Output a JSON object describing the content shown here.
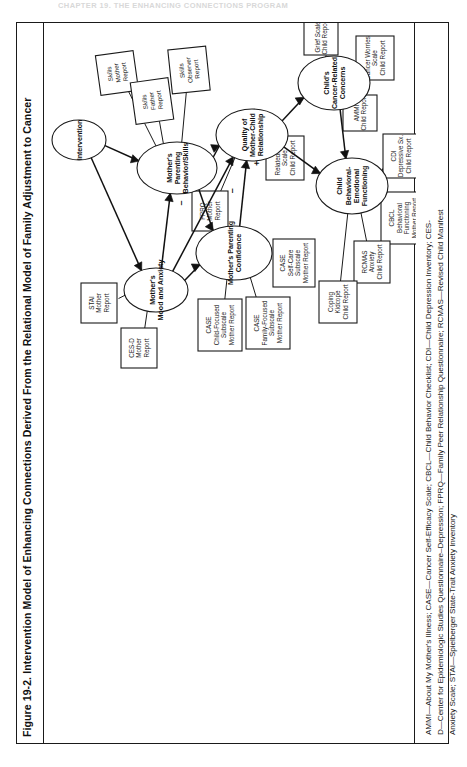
{
  "running_head": "CHAPTER 19. THE ENHANCING CONNECTIONS PROGRAM",
  "figure": {
    "title": "Figure 19-2. Intervention Model of Enhancing Connections Derived From the Relational Model of Family Adjustment to Cancer",
    "legend_line_1": "AMMI—About My Mother's Illness; CASE—Cancer Self-Efficacy Scale; CBCL—Child Behavior Checklist; CDI—Child Depression Inventory; CES-",
    "legend_line_2": "D—Center for Epidemiologic Studies Questionnaire–Depression; FPRQ—Family Peer Relationship Questionnaire; RCMAS—Revised Child Manifest",
    "legend_line_3": "Anxiety Scale; STAI—Spielberger State-Trait Anxiety Inventory"
  },
  "chart_data": {
    "type": "diagram",
    "title": "Intervention Model of Enhancing Connections Derived From the Relational Model of Family Adjustment to Cancer",
    "constructs": [
      {
        "id": "intervention",
        "label": "Intervention"
      },
      {
        "id": "mother_skills",
        "label_lines": [
          "Mother's",
          "Parenting",
          "Behavior/Skills"
        ]
      },
      {
        "id": "mother_mood",
        "label_lines": [
          "Mother's",
          "Mood and Anxiety"
        ]
      },
      {
        "id": "mother_confidence",
        "label_lines": [
          "Mother's Parenting",
          "Confidence"
        ]
      },
      {
        "id": "quality_relationship",
        "label_lines": [
          "Quality of",
          "Mother-Child",
          "Relationship"
        ]
      },
      {
        "id": "child_concerns",
        "label_lines": [
          "Child's",
          "Cancer-Related",
          "Concerns"
        ]
      },
      {
        "id": "child_behavioral",
        "label_lines": [
          "Child",
          "Behavioral-",
          "Emotional",
          "Functioning"
        ]
      }
    ],
    "measures": [
      {
        "id": "skills_mother",
        "lines": [
          "Skills",
          "Mother",
          "Report"
        ],
        "construct": "mother_skills"
      },
      {
        "id": "skills_father",
        "lines": [
          "Skills",
          "Father",
          "Report"
        ],
        "construct": "mother_skills"
      },
      {
        "id": "skills_observer",
        "lines": [
          "Skills",
          "Observer",
          "Report"
        ],
        "construct": "mother_skills"
      },
      {
        "id": "stai_mother",
        "lines": [
          "STAI",
          "Mother",
          "Report"
        ],
        "construct": "mother_mood"
      },
      {
        "id": "cesd_mother",
        "lines": [
          "CES-D",
          "Mother",
          "Report"
        ],
        "construct": "mother_mood"
      },
      {
        "id": "case_child_focused",
        "lines": [
          "CASE",
          "Child-Focused",
          "Subscale",
          "Mother Report"
        ],
        "construct": "mother_confidence"
      },
      {
        "id": "case_family_focused",
        "lines": [
          "CASE",
          "Family-Focused",
          "Subscale",
          "Mother Report"
        ],
        "construct": "mother_confidence"
      },
      {
        "id": "case_self_care",
        "lines": [
          "CASE",
          "Self-Care",
          "Subscale",
          "Mother Report"
        ],
        "construct": "mother_confidence"
      },
      {
        "id": "fprq_mother",
        "lines": [
          "FPRQ",
          "Mother",
          "Report"
        ],
        "construct": "quality_relationship"
      },
      {
        "id": "relatedness_scale",
        "lines": [
          "Relatedness",
          "Scale",
          "Child Report"
        ],
        "construct": "quality_relationship"
      },
      {
        "id": "grief_scale",
        "lines": [
          "Grief Scale",
          "Child Report"
        ],
        "construct": "child_concerns"
      },
      {
        "id": "cancer_worries",
        "lines": [
          "Cancer Worries",
          "Scale",
          "Child Report"
        ],
        "construct": "child_concerns"
      },
      {
        "id": "ammi_child",
        "lines": [
          "AMMI",
          "Child Report"
        ],
        "construct": "child_concerns"
      },
      {
        "id": "cdi_child",
        "lines": [
          "CDI",
          "Depressive Sx.",
          "Child Report"
        ],
        "construct": "child_behavioral"
      },
      {
        "id": "cbcl_mother",
        "lines": [
          "CBCL",
          "Behavioral",
          "Functioning",
          "Mother Report"
        ],
        "construct": "child_behavioral"
      },
      {
        "id": "rcmas_child",
        "lines": [
          "RCMAS",
          "Anxiety",
          "Child Report"
        ],
        "construct": "child_behavioral"
      },
      {
        "id": "coping_kidcope",
        "lines": [
          "Coping",
          "Kidcope",
          "Child Report"
        ],
        "construct": "child_behavioral"
      }
    ],
    "paths": [
      {
        "from": "intervention",
        "to": "mother_skills",
        "sign": ""
      },
      {
        "from": "intervention",
        "to": "mother_mood",
        "sign": ""
      },
      {
        "from": "mother_skills",
        "to": "mother_confidence",
        "sign": "+"
      },
      {
        "from": "mother_skills",
        "to": "quality_relationship",
        "sign": "+"
      },
      {
        "from": "mother_mood",
        "to": "mother_skills",
        "sign": "-"
      },
      {
        "from": "mother_mood",
        "to": "mother_confidence",
        "sign": "-"
      },
      {
        "from": "mother_mood",
        "to": "quality_relationship",
        "sign": "-"
      },
      {
        "from": "mother_confidence",
        "to": "quality_relationship",
        "sign": "+"
      },
      {
        "from": "quality_relationship",
        "to": "child_concerns",
        "sign": "-"
      },
      {
        "from": "quality_relationship",
        "to": "child_behavioral",
        "sign": "-"
      },
      {
        "from": "child_concerns",
        "to": "child_behavioral",
        "sign": ""
      }
    ],
    "signs": [
      "+",
      "-"
    ]
  }
}
